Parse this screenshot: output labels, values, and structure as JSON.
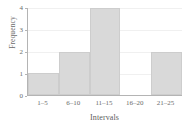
{
  "chart_data": {
    "type": "bar",
    "title": "",
    "subtitle": "",
    "categories": [
      "1–5",
      "6–10",
      "11–15",
      "16–20",
      "21–25"
    ],
    "values": [
      1,
      2,
      4,
      0,
      2
    ],
    "xlabel": "Intervals",
    "ylabel": "Frequency",
    "ylim": [
      0,
      4
    ],
    "yticks": [
      0,
      1,
      2,
      3,
      4
    ],
    "ytick_labels": [
      "0",
      "1",
      "2",
      "3",
      "4"
    ],
    "grid": "horizontal-faint",
    "legend": "none",
    "series": [
      {
        "name": "Frequency",
        "values": [
          1,
          2,
          4,
          0,
          2
        ]
      }
    ],
    "annotations": []
  },
  "style": {
    "bar_fill": "#d9d9d9",
    "bar_border": "#cdcdcd",
    "axis_color": "#b4b4b4",
    "grid_color": "#f0f0f0",
    "tick_text_color": "#6b6b6b",
    "axis_title_color": "#5c5c5c",
    "background": "#ffffff"
  }
}
